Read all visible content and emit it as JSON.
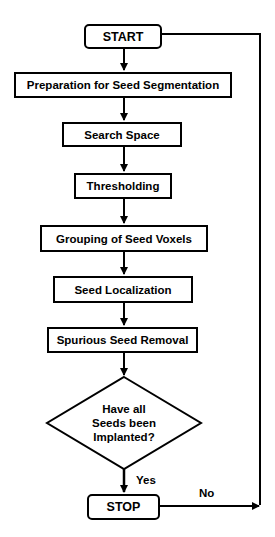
{
  "flowchart": {
    "start": "START",
    "steps": [
      "Preparation for Seed Segmentation",
      "Search Space",
      "Thresholding",
      "Grouping of Seed Voxels",
      "Seed Localization",
      "Spurious Seed Removal"
    ],
    "decision": {
      "line1": "Have all",
      "line2": "Seeds been",
      "line3": "Implanted?"
    },
    "yes_label": "Yes",
    "no_label": "No",
    "stop": "STOP"
  },
  "colors": {
    "line": "#000000",
    "background": "#ffffff"
  }
}
